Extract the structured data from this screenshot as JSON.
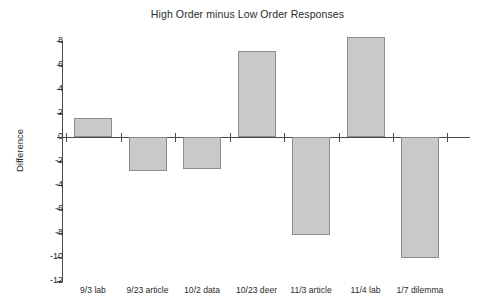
{
  "chart_data": {
    "type": "bar",
    "title": "High Order minus Low Order Responses",
    "xlabel": "",
    "ylabel": "Difference",
    "categories": [
      "9/3 lab",
      "9/23 article",
      "10/2 data",
      "10/23 deer",
      "11/3 article",
      "11/4 lab",
      "1/7 dilemma"
    ],
    "values": [
      1.6,
      -2.8,
      -2.7,
      7.2,
      -8.2,
      8.3,
      -10.1
    ],
    "ylim": [
      -12,
      8
    ],
    "yticks": [
      8,
      6,
      4,
      2,
      0,
      -2,
      -4,
      -6,
      -8,
      -10,
      -12
    ],
    "ytick_labels": [
      "8",
      "6",
      "4",
      "2",
      "0",
      "-2",
      "-4",
      "-6",
      "-8",
      "-10",
      "-12"
    ],
    "grid": false,
    "legend": false,
    "bar_color": "#c9c9c9",
    "bar_border_color": "#8d8d8d",
    "axis_color": "#4a4a4a"
  }
}
